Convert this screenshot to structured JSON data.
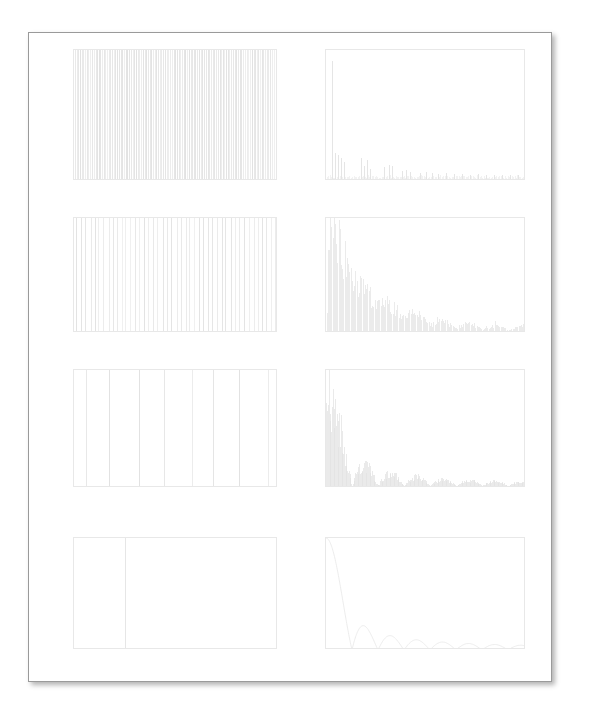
{
  "page": {
    "background_color": "#ffffff",
    "frame_color": "#9a9a9a",
    "line_color": "#e2e2e2",
    "tick_color": "#dadada"
  },
  "chart_data": [
    {
      "id": "time-1",
      "type": "bar",
      "title": "",
      "xlabel": "s",
      "ylabel": "",
      "xlim": [
        0,
        1.0
      ],
      "ylim": [
        0,
        5.0
      ],
      "xticks": [
        "0.000",
        "0.250",
        "0.500",
        "0.750",
        "1.000"
      ],
      "xtick_values": [
        0.0,
        0.25,
        0.5,
        0.75,
        1.0
      ],
      "yticks": [
        "0.0",
        "0.5",
        "1.0",
        "1.5",
        "2.0",
        "2.5",
        "3.0",
        "3.5",
        "4.0",
        "4.5",
        "5.0"
      ],
      "ytick_values": [
        0.0,
        0.5,
        1.0,
        1.5,
        2.0,
        2.5,
        3.0,
        3.5,
        4.0,
        4.5,
        5.0
      ],
      "grid": false,
      "description": "Dense pulse train, ~120 impulses spanning full height",
      "n_pulses": 120,
      "pulse_height": 5.0
    },
    {
      "id": "spec-1",
      "type": "bar",
      "title": "",
      "xlabel": "Hz",
      "ylabel": "",
      "xlim": [
        0,
        1000
      ],
      "ylim": [
        0,
        2.5
      ],
      "xticks": [
        "0",
        "250",
        "500",
        "750",
        "1000"
      ],
      "xtick_values": [
        0,
        250,
        500,
        750,
        1000
      ],
      "yticks": [
        "0.00",
        "0.25",
        "0.50",
        "0.75",
        "1.00",
        "1.25",
        "1.50",
        "1.75",
        "2.00",
        "2.25",
        "2.50"
      ],
      "ytick_values": [
        0.0,
        0.25,
        0.5,
        0.75,
        1.0,
        1.25,
        1.5,
        1.75,
        2.0,
        2.25,
        2.5
      ],
      "grid": false,
      "description": "Line spectrum, dominant peak near 30 Hz at 2.25, decaying harmonics",
      "peaks": [
        {
          "freq": 30,
          "amp": 2.25
        },
        {
          "freq": 45,
          "amp": 0.5
        },
        {
          "freq": 60,
          "amp": 0.45
        },
        {
          "freq": 75,
          "amp": 0.4
        },
        {
          "freq": 90,
          "amp": 0.33
        },
        {
          "freq": 175,
          "amp": 0.4
        },
        {
          "freq": 190,
          "amp": 0.24
        },
        {
          "freq": 205,
          "amp": 0.36
        },
        {
          "freq": 220,
          "amp": 0.2
        },
        {
          "freq": 290,
          "amp": 0.22
        },
        {
          "freq": 315,
          "amp": 0.27
        },
        {
          "freq": 330,
          "amp": 0.25
        },
        {
          "freq": 380,
          "amp": 0.15
        },
        {
          "freq": 400,
          "amp": 0.17
        },
        {
          "freq": 420,
          "amp": 0.13
        },
        {
          "freq": 470,
          "amp": 0.12
        },
        {
          "freq": 500,
          "amp": 0.14
        },
        {
          "freq": 530,
          "amp": 0.11
        },
        {
          "freq": 560,
          "amp": 0.1
        },
        {
          "freq": 600,
          "amp": 0.12
        },
        {
          "freq": 640,
          "amp": 0.09
        },
        {
          "freq": 680,
          "amp": 0.1
        },
        {
          "freq": 720,
          "amp": 0.08
        },
        {
          "freq": 760,
          "amp": 0.09
        },
        {
          "freq": 800,
          "amp": 0.08
        },
        {
          "freq": 840,
          "amp": 0.08
        },
        {
          "freq": 880,
          "amp": 0.07
        },
        {
          "freq": 920,
          "amp": 0.08
        },
        {
          "freq": 960,
          "amp": 0.07
        }
      ]
    },
    {
      "id": "time-2",
      "type": "bar",
      "title": "",
      "xlabel": "ms",
      "ylabel": "",
      "xlim": [
        0,
        1000
      ],
      "ylim": [
        0,
        5.0
      ],
      "xticks": [
        "0",
        "50",
        "150",
        "250",
        "350",
        "450",
        "550",
        "650",
        "750",
        "850",
        "950"
      ],
      "xtick_values": [
        0,
        50,
        150,
        250,
        350,
        450,
        550,
        650,
        750,
        850,
        950
      ],
      "yticks": [
        "0.0",
        "0.5",
        "1.0",
        "1.5",
        "2.0",
        "2.5",
        "3.0",
        "3.5",
        "4.0",
        "4.5",
        "5.0"
      ],
      "ytick_values": [
        0.0,
        0.5,
        1.0,
        1.5,
        2.0,
        2.5,
        3.0,
        3.5,
        4.0,
        4.5,
        5.0
      ],
      "grid": false,
      "description": "Medium density pulse train, ~45 impulses",
      "n_pulses": 45,
      "pulse_height": 5.0
    },
    {
      "id": "spec-2",
      "type": "bar",
      "title": "",
      "xlabel": "Hz",
      "ylabel": "",
      "xlim": [
        0,
        1000
      ],
      "ylim": [
        0,
        1.25
      ],
      "xticks": [
        "0",
        "250",
        "500",
        "750",
        "1000"
      ],
      "xtick_values": [
        0,
        250,
        500,
        750,
        1000
      ],
      "yticks": [
        "0.00",
        "0.25",
        "0.50",
        "0.75",
        "1.00",
        "1.25"
      ],
      "ytick_values": [
        0.0,
        0.25,
        0.5,
        0.75,
        1.0,
        1.25
      ],
      "grid": false,
      "description": "Dense line spectrum, peak ~1.22 near 15 Hz, decaying with lobes",
      "envelope_peak": 1.22,
      "envelope_peak_freq": 15
    },
    {
      "id": "time-3",
      "type": "bar",
      "title": "",
      "xlabel": "s",
      "ylabel": "",
      "xlim": [
        0,
        1.0
      ],
      "ylim": [
        0,
        5.0
      ],
      "xticks": [
        "0.000",
        "0.250",
        "0.500",
        "0.750",
        "1.000"
      ],
      "xtick_values": [
        0.0,
        0.25,
        0.5,
        0.75,
        1.0
      ],
      "yticks": [
        "0.0",
        "0.5",
        "1.0",
        "1.5",
        "2.0",
        "2.5",
        "3.0",
        "3.5",
        "4.0",
        "4.5",
        "5.0"
      ],
      "ytick_values": [
        0.0,
        0.5,
        1.0,
        1.5,
        2.0,
        2.5,
        3.0,
        3.5,
        4.0,
        4.5,
        5.0
      ],
      "grid": false,
      "description": "Sparse pulse train, 8 impulses evenly spaced",
      "n_pulses": 8,
      "pulse_height": 5.0
    },
    {
      "id": "spec-3",
      "type": "bar",
      "title": "",
      "xlabel": "Hz",
      "ylabel": "",
      "xlim": [
        0,
        1000
      ],
      "ylim": [
        0,
        0.7
      ],
      "xticks": [
        "0",
        "250",
        "500",
        "750",
        "1000"
      ],
      "xtick_values": [
        0,
        250,
        500,
        750,
        1000
      ],
      "yticks": [
        "0.0",
        "0.1",
        "0.2",
        "0.3",
        "0.4",
        "0.5",
        "0.6",
        "0.7"
      ],
      "ytick_values": [
        0.0,
        0.1,
        0.2,
        0.3,
        0.4,
        0.5,
        0.6,
        0.7
      ],
      "grid": false,
      "description": "Sinc-envelope line spectrum, main lobe peak 0.62 near 10 Hz, first null near 130 Hz",
      "envelope_peak": 0.62,
      "first_null_freq": 130
    },
    {
      "id": "time-4",
      "type": "bar",
      "title": "",
      "xlabel": "ms",
      "ylabel": "",
      "xlim": [
        0,
        1000
      ],
      "ylim": [
        0,
        5.0
      ],
      "xticks": [
        "0",
        "50",
        "150",
        "250",
        "350",
        "450",
        "550",
        "650",
        "750",
        "850",
        "950"
      ],
      "xtick_values": [
        0,
        50,
        150,
        250,
        350,
        450,
        550,
        650,
        750,
        850,
        950
      ],
      "yticks": [
        "0.0",
        "0.5",
        "1.0",
        "1.5",
        "2.0",
        "2.5",
        "3.0",
        "3.5",
        "4.0",
        "4.5",
        "5.0"
      ],
      "ytick_values": [
        0.0,
        0.5,
        1.0,
        1.5,
        2.0,
        2.5,
        3.0,
        3.5,
        4.0,
        4.5,
        5.0
      ],
      "grid": false,
      "description": "Single impulse at 250 ms with amplitude 5.0",
      "n_pulses": 1,
      "pulse_height": 5.0,
      "pulse_positions_ms": [
        250
      ]
    },
    {
      "id": "spec-4",
      "type": "line",
      "title": "",
      "xlabel": "Hz",
      "ylabel": "",
      "xlim": [
        0,
        1000
      ],
      "ylim": [
        0,
        0.08
      ],
      "xticks": [
        "0",
        "250",
        "500",
        "750",
        "1000"
      ],
      "xtick_values": [
        0,
        250,
        500,
        750,
        1000
      ],
      "yticks": [
        "0.00",
        "0.01",
        "0.02",
        "0.03",
        "0.04",
        "0.05",
        "0.06",
        "0.07",
        "0.08"
      ],
      "ytick_values": [
        0.0,
        0.01,
        0.02,
        0.03,
        0.04,
        0.05,
        0.06,
        0.07,
        0.08
      ],
      "grid": false,
      "description": "Smooth rectified sinc magnitude curve, DC 0.08 falling to first null near 130 Hz, then decaying lobes",
      "envelope_peak": 0.08,
      "first_null_freq": 130,
      "lobe_period": 143
    }
  ]
}
